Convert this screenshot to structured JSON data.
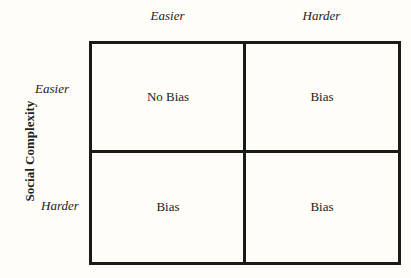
{
  "columns": {
    "header_1": "Easier",
    "header_2": "Harder"
  },
  "rows": {
    "axis_title": "Social Complexity",
    "header_1": "Easier",
    "header_2": "Harder"
  },
  "cells": {
    "r1c1": "No Bias",
    "r1c2": "Bias",
    "r2c1": "Bias",
    "r2c2": "Bias"
  }
}
